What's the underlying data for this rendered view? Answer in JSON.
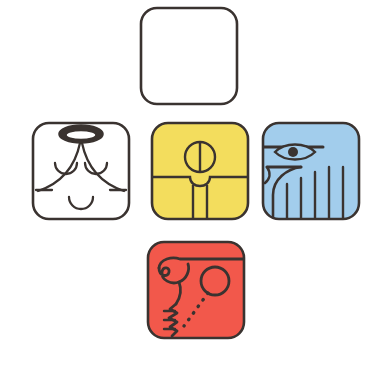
{
  "artwork": {
    "title": "Mayan Day-Sign Glyph Cartouches",
    "layout": "cross",
    "canvas": {
      "width": 368,
      "height": 367,
      "background": "#ffffff"
    },
    "stroke_color": "#3a3330",
    "stroke_width": 2.6,
    "corner_radius": 16
  },
  "palette": {
    "outline": "#3a3330",
    "white": "#ffffff",
    "yellow": "#f3dd5d",
    "blue": "#a2cdec",
    "red": "#f2584b",
    "paper": "#ffffff"
  },
  "tiles": [
    {
      "id": "north",
      "position": "north",
      "fill_color": "#ffffff",
      "fill_name": "white",
      "glyph_name": "blank-cartouche",
      "label": "Blank Cartouche",
      "motifs": []
    },
    {
      "id": "west",
      "position": "west",
      "fill_color": "#ffffff",
      "fill_name": "white",
      "glyph_name": "closed-eyes-face",
      "label": "White Closed-Eyes Face",
      "motifs": [
        "top-ellipse-ring",
        "left-closed-eye-arc",
        "right-closed-eye-arc",
        "inverted-v-cheek-curves",
        "horizontal-jaw-line",
        "smile-arc"
      ]
    },
    {
      "id": "center",
      "position": "center",
      "fill_color": "#f3dd5d",
      "fill_name": "yellow",
      "glyph_name": "split-circle-figure",
      "label": "Yellow Split-Circle Figure",
      "motifs": [
        "circle-with-vertical-bar",
        "shoulder-horizontal-line",
        "torso-notch",
        "two-vertical-legs"
      ]
    },
    {
      "id": "east",
      "position": "east",
      "fill_color": "#a2cdec",
      "fill_name": "blue",
      "glyph_name": "eye-and-feathers",
      "label": "Blue Eye and Feathers",
      "motifs": [
        "brow-line",
        "lens-eye-with-pupil",
        "hook-beak-curve",
        "five-vertical-feather-lines"
      ]
    },
    {
      "id": "south",
      "position": "south",
      "fill_color": "#f2584b",
      "fill_name": "red",
      "glyph_name": "spiral-and-circle",
      "label": "Red Spiral and Circle",
      "motifs": [
        "top-horizontal-line",
        "left-spiral-scroll",
        "open-circle",
        "dotted-diagonal-line",
        "vertical-zigzag-with-ticks"
      ]
    }
  ]
}
